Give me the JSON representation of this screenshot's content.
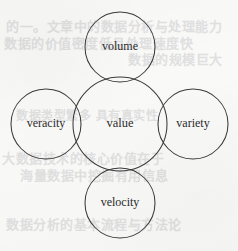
{
  "page": {
    "background_color": "#f9f9f8",
    "stroke_color": "#3b3b3b",
    "label_color": "#2b2b2b",
    "bleed_text_color": "#dedede"
  },
  "chart_data": {
    "type": "diagram",
    "subtype": "venn-cluster",
    "title": "",
    "nodes": [
      {
        "id": "volume",
        "label": "volume",
        "role": "satellite",
        "position": "top",
        "cx": 120,
        "cy": 47,
        "r": 35
      },
      {
        "id": "veracity",
        "label": "veracity",
        "role": "satellite",
        "position": "left",
        "cx": 46,
        "cy": 124,
        "r": 35
      },
      {
        "id": "value",
        "label": "value",
        "role": "center",
        "position": "center",
        "cx": 120,
        "cy": 124,
        "r": 47
      },
      {
        "id": "variety",
        "label": "variety",
        "role": "satellite",
        "position": "right",
        "cx": 193,
        "cy": 124,
        "r": 35
      },
      {
        "id": "velocity",
        "label": "velocity",
        "role": "satellite",
        "position": "bottom",
        "cx": 120,
        "cy": 203,
        "r": 35
      }
    ],
    "overlaps": [
      [
        "value",
        "volume"
      ],
      [
        "value",
        "veracity"
      ],
      [
        "value",
        "variety"
      ],
      [
        "value",
        "velocity"
      ]
    ],
    "legend": [],
    "annotations": []
  },
  "bleed_through": {
    "note": "faint ghost text showing through the scanned paper",
    "lines": [
      {
        "text": "的一。文章中的数据分析与处理能力",
        "x": 6,
        "y": 16,
        "size": 13
      },
      {
        "text": "数据的价值密度低且处理速度快",
        "x": 4,
        "y": 33,
        "size": 13
      },
      {
        "text": "数据的规模巨大",
        "x": 128,
        "y": 49,
        "size": 13
      },
      {
        "text": "数据类型繁多 具有真实性",
        "x": 16,
        "y": 106,
        "size": 12
      },
      {
        "text": "大数据技术的核心价值在于",
        "x": 2,
        "y": 148,
        "size": 13
      },
      {
        "text": "海量数据中挖掘有用信息",
        "x": 20,
        "y": 165,
        "size": 13
      },
      {
        "text": "数据分析的基本流程与方法论",
        "x": 6,
        "y": 214,
        "size": 13
      }
    ]
  }
}
